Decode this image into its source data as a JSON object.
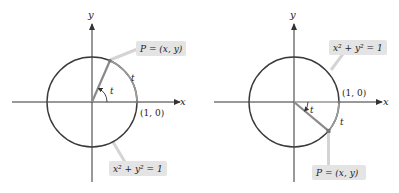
{
  "colors": {
    "axis": "#333333",
    "circle": "#3a3a3a",
    "radius": "#8a8a8a",
    "arc_highlight": "#9a9a9a",
    "label_box": "#e4e4e4",
    "leader_line": "#d0d0d0",
    "text": "#222222"
  },
  "left": {
    "axis_x_label": "x",
    "axis_y_label": "y",
    "point_label": "P = (x, y)",
    "equation_label": "x² + y² = 1",
    "unit_point_label": "(1, 0)",
    "arc_label": "t",
    "angle_label": "t"
  },
  "right": {
    "axis_x_label": "x",
    "axis_y_label": "y",
    "point_label": "P = (x, y)",
    "equation_label": "x² + y² = 1",
    "unit_point_label": "(1, 0)",
    "arc_label": "t",
    "angle_label": "t"
  }
}
